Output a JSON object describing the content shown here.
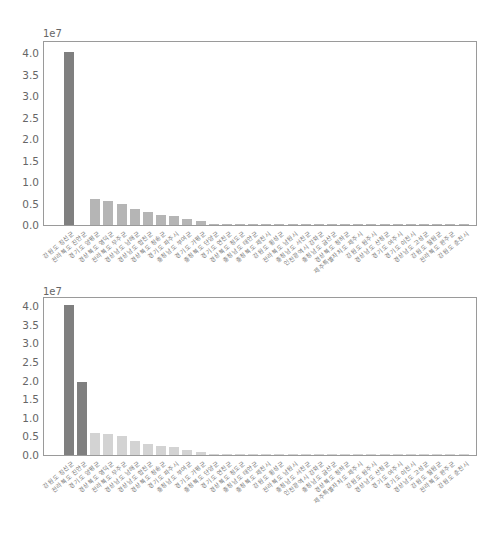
{
  "chart_data": [
    {
      "type": "bar",
      "title": "",
      "xlabel": "",
      "ylabel": "",
      "y_scale_label": "1e7",
      "ylim": [
        0,
        4.2
      ],
      "yticks": [
        "0.0",
        "0.5",
        "1.0",
        "1.5",
        "2.0",
        "2.5",
        "3.0",
        "3.5",
        "4.0"
      ],
      "grid": false,
      "categories": [
        "강원도 정선군",
        "전라북도 진안군",
        "경기도 양평군",
        "경상북도 영덕군",
        "전라북도 무주군",
        "경상남도 남해군",
        "경상남도 합천군",
        "경상북도 청송군",
        "경기도 파주시",
        "충청남도 부여군",
        "경기도 가평군",
        "충청북도 단양군",
        "경기도 연천군",
        "경상북도 청도군",
        "충청남도 태안군",
        "충청북도 제천시",
        "강원도 횡성군",
        "전라북도 남원시",
        "충청남도 서천군",
        "인천광역시 강화군",
        "충청남도 금산군",
        "경상북도 청하군",
        "제주특별자치도 제주시",
        "강원도 원주시",
        "경상남도 산청군",
        "경기도 여주시",
        "경기도 이천시",
        "경상남도 고성군",
        "강원도 철원군",
        "전라북도 완주군",
        "강원도 춘천시"
      ],
      "values": [
        4.02,
        0.0,
        0.6,
        0.56,
        0.5,
        0.37,
        0.3,
        0.23,
        0.22,
        0.14,
        0.09,
        0.03,
        0.03,
        0.03,
        0.03,
        0.02,
        0.02,
        0.02,
        0.02,
        0.02,
        0.02,
        0.02,
        0.02,
        0.02,
        0.02,
        0.02,
        0.01,
        0.01,
        0.01,
        0.01,
        0.01
      ],
      "colors": [
        "#7f7f7f",
        "#7f7f7f",
        "#b5b5b5",
        "#b5b5b5",
        "#b5b5b5",
        "#b5b5b5",
        "#b5b5b5",
        "#b5b5b5",
        "#b5b5b5",
        "#b5b5b5",
        "#b5b5b5",
        "#b5b5b5",
        "#b5b5b5",
        "#b5b5b5",
        "#b5b5b5",
        "#b5b5b5",
        "#b5b5b5",
        "#b5b5b5",
        "#b5b5b5",
        "#b5b5b5",
        "#b5b5b5",
        "#b5b5b5",
        "#b5b5b5",
        "#b5b5b5",
        "#b5b5b5",
        "#b5b5b5",
        "#b5b5b5",
        "#b5b5b5",
        "#b5b5b5",
        "#b5b5b5",
        "#b5b5b5"
      ]
    },
    {
      "type": "bar",
      "title": "",
      "xlabel": "",
      "ylabel": "",
      "y_scale_label": "1e7",
      "ylim": [
        0,
        4.2
      ],
      "yticks": [
        "0.0",
        "0.5",
        "1.0",
        "1.5",
        "2.0",
        "2.5",
        "3.0",
        "3.5",
        "4.0"
      ],
      "grid": false,
      "categories": [
        "강원도 정선군",
        "전라북도 진안군",
        "경기도 양평군",
        "경상북도 영덕군",
        "전라북도 무주군",
        "경상남도 남해군",
        "경상남도 합천군",
        "경상북도 청송군",
        "경기도 파주시",
        "충청남도 부여군",
        "경기도 가평군",
        "충청북도 단양군",
        "경기도 연천군",
        "경상북도 청도군",
        "충청남도 태안군",
        "충청북도 제천시",
        "강원도 횡성군",
        "전라북도 남원시",
        "충청남도 서천군",
        "인천광역시 강화군",
        "충청남도 금산군",
        "경상북도 청하군",
        "제주특별자치도 제주시",
        "강원도 원주시",
        "경상남도 산청군",
        "경기도 여주시",
        "경기도 이천시",
        "경상남도 고성군",
        "강원도 철원군",
        "전라북도 완주군",
        "강원도 춘천시"
      ],
      "values": [
        4.02,
        1.97,
        0.6,
        0.56,
        0.5,
        0.37,
        0.3,
        0.23,
        0.22,
        0.14,
        0.09,
        0.03,
        0.03,
        0.03,
        0.03,
        0.02,
        0.02,
        0.02,
        0.02,
        0.02,
        0.02,
        0.02,
        0.02,
        0.02,
        0.02,
        0.02,
        0.01,
        0.01,
        0.01,
        0.01,
        0.01
      ],
      "colors": [
        "#7f7f7f",
        "#7f7f7f",
        "#d3d3d3",
        "#d3d3d3",
        "#d3d3d3",
        "#d3d3d3",
        "#d3d3d3",
        "#d3d3d3",
        "#d3d3d3",
        "#d3d3d3",
        "#d3d3d3",
        "#d3d3d3",
        "#d3d3d3",
        "#d3d3d3",
        "#d3d3d3",
        "#d3d3d3",
        "#d3d3d3",
        "#d3d3d3",
        "#d3d3d3",
        "#d3d3d3",
        "#d3d3d3",
        "#d3d3d3",
        "#d3d3d3",
        "#d3d3d3",
        "#d3d3d3",
        "#d3d3d3",
        "#d3d3d3",
        "#d3d3d3",
        "#d3d3d3",
        "#d3d3d3",
        "#d3d3d3"
      ]
    }
  ]
}
